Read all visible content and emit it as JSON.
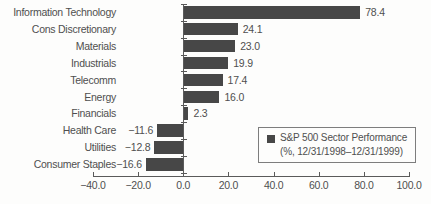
{
  "chart_data": {
    "type": "bar",
    "orientation": "horizontal",
    "title": "",
    "xlabel": "",
    "ylabel": "",
    "categories": [
      "Information Technology",
      "Cons Discretionary",
      "Materials",
      "Industrials",
      "Telecomm",
      "Energy",
      "Financials",
      "Health Care",
      "Utilities",
      "Consumer Staples"
    ],
    "values": [
      78.4,
      24.1,
      23.0,
      19.9,
      17.4,
      16.0,
      2.3,
      -11.6,
      -12.8,
      -16.6
    ],
    "value_labels": [
      "78.4",
      "24.1",
      "23.0",
      "19.9",
      "17.4",
      "16.0",
      "2.3",
      "−11.6",
      "−12.8",
      "−16.6"
    ],
    "xlim": [
      -40,
      100
    ],
    "xticks": [
      -40,
      -20,
      0,
      20,
      40,
      60,
      80,
      100
    ],
    "xtick_labels": [
      "−40.0",
      "−20.0",
      "0.0",
      "20.0",
      "40.0",
      "60.0",
      "80.0",
      "100.0"
    ],
    "grid": false,
    "legend_position": "lower-right"
  },
  "legend": {
    "line1": "S&P 500 Sector Performance",
    "line2": "(%, 12/31/1998–12/31/1999)"
  },
  "colors": {
    "bar": "#474747",
    "text": "#4f4f4f",
    "axis": "#5a5a5a",
    "legend_border": "#7d7d7d",
    "background": "#fdfdfc"
  }
}
